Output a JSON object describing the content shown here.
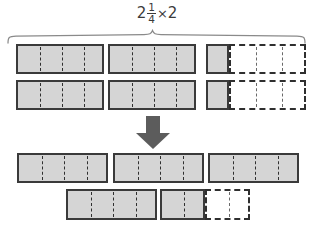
{
  "figure": {
    "kind": "fraction-area-model",
    "title_expression": {
      "whole": "2",
      "numerator": "1",
      "denominator": "4",
      "operator": "×",
      "factor": "2",
      "plain": "2 1/4 × 2"
    },
    "colors": {
      "fill": "#d5d5d5",
      "stroke": "#3a3a3a",
      "dashed_stroke": "#2f2f2f",
      "arrow": "#5c5c5c",
      "text": "#3b3b3b",
      "background": "#ffffff"
    },
    "brace": {
      "name": "top-brace",
      "label": "",
      "spans": "the two copies of 2 1/4 shown above"
    },
    "arrow": {
      "name": "down-arrow",
      "direction": "down",
      "label": ""
    },
    "top_group": {
      "name": "factor-rows",
      "description": "Two identical rows, each showing 2 1/4 as area model: two whole rectangles (4 fourths each) plus one shaded fourth and three unshaded fourths.",
      "row_count": "2",
      "rows": [
        {
          "name": "top-row-1",
          "whole_rects": "2",
          "shaded_fourths": "1",
          "empty_fourths": "3"
        },
        {
          "name": "top-row-2",
          "whole_rects": "2",
          "shaded_fourths": "1",
          "empty_fourths": "3"
        }
      ]
    },
    "bottom_group": {
      "name": "product-rows",
      "description": "Result 4 1/2 regrouped: four whole rectangles plus two shaded fourths and two unshaded fourths.",
      "row_count": "2",
      "rows": [
        {
          "name": "bottom-row-1",
          "whole_rects": "3",
          "shaded_fourths": "0",
          "empty_fourths": "0"
        },
        {
          "name": "bottom-row-2",
          "whole_rects": "1",
          "shaded_fourths": "2",
          "empty_fourths": "2"
        }
      ]
    }
  }
}
